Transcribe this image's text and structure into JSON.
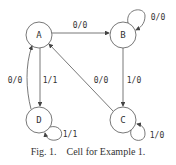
{
  "diagram": {
    "type": "state-machine",
    "states": [
      {
        "id": "A",
        "label": "A"
      },
      {
        "id": "B",
        "label": "B"
      },
      {
        "id": "C",
        "label": "C"
      },
      {
        "id": "D",
        "label": "D"
      }
    ],
    "transitions": [
      {
        "from": "A",
        "to": "B",
        "label": "0/0"
      },
      {
        "from": "B",
        "to": "B",
        "label": "0/0"
      },
      {
        "from": "B",
        "to": "C",
        "label": "1/0"
      },
      {
        "from": "C",
        "to": "C",
        "label": "1/0"
      },
      {
        "from": "C",
        "to": "A",
        "label": "0/0"
      },
      {
        "from": "A",
        "to": "D",
        "label": "1/1"
      },
      {
        "from": "D",
        "to": "A",
        "label": "0/0"
      },
      {
        "from": "D",
        "to": "D",
        "label": "1/1"
      }
    ]
  },
  "caption": {
    "fig_number": "Fig. 1.",
    "text": "Cell for Example 1."
  }
}
